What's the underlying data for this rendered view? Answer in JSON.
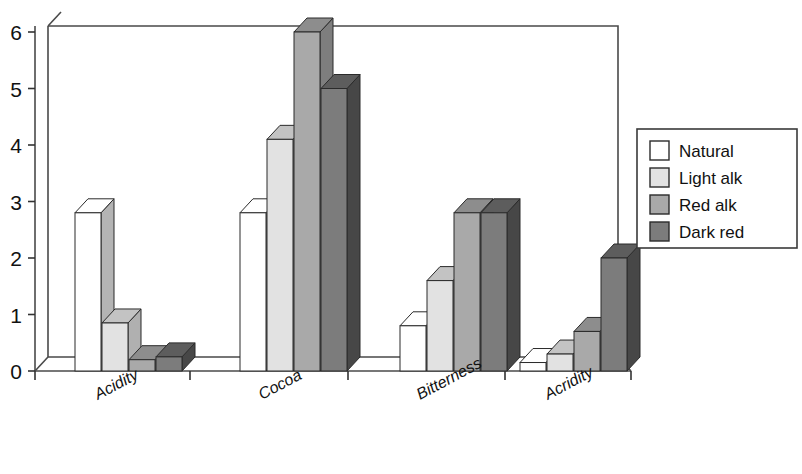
{
  "chart_data": {
    "type": "bar",
    "title": "",
    "subtitle": "",
    "xlabel": "",
    "ylabel": "",
    "categories": [
      "Acidity",
      "Cocoa",
      "Bitterness",
      "Acridity"
    ],
    "series": [
      {
        "name": "Natural",
        "color": "#ffffff",
        "top_color": "#ffffff",
        "side_color": "#b4b4b4",
        "values": [
          2.8,
          2.8,
          0.8,
          0.15
        ]
      },
      {
        "name": "Light alk",
        "color": "#e2e2e2",
        "top_color": "#c3c3c3",
        "side_color": "#b0b0b0",
        "values": [
          0.85,
          4.1,
          1.6,
          0.3
        ]
      },
      {
        "name": "Red alk",
        "color": "#a9a9a9",
        "top_color": "#8d8d8d",
        "side_color": "#7e7e7e",
        "values": [
          0.2,
          6.0,
          2.8,
          0.7
        ]
      },
      {
        "name": "Dark red",
        "color": "#7c7c7c",
        "top_color": "#5d5d5d",
        "side_color": "#474747",
        "values": [
          0.25,
          5.0,
          2.8,
          2.0
        ]
      }
    ],
    "ylim": [
      0,
      6
    ],
    "yticks": [
      0,
      1,
      2,
      3,
      4,
      5,
      6
    ],
    "ytick_labels": [
      "0",
      "1",
      "2",
      "3",
      "4",
      "5",
      "6"
    ],
    "grid": false,
    "legend_position": "right",
    "three_d": true
  },
  "axis": {
    "y_tick_labels": [
      "6",
      "5",
      "4",
      "3",
      "2",
      "1",
      "0"
    ]
  },
  "legend": {
    "entries": [
      {
        "label": "Natural"
      },
      {
        "label": "Light alk"
      },
      {
        "label": "Red alk"
      },
      {
        "label": "Dark red"
      }
    ]
  }
}
